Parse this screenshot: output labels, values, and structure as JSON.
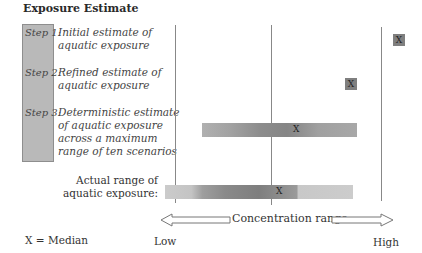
{
  "title": "Exposure Estimate",
  "steps": [
    {
      "label": "Step 1:",
      "description_lines": [
        "Initial estimate of",
        "aquatic exposure"
      ]
    },
    {
      "label": "Step 2:",
      "description_lines": [
        "Refined estimate of",
        "aquatic exposure"
      ]
    },
    {
      "label": "Step 3:",
      "description_lines": [
        "Deterministic estimate",
        "of aquatic exposure",
        "across a maximum",
        "range of ten scenarios"
      ]
    }
  ],
  "actual_range_label_lines": [
    "Actual range of",
    "aquatic exposure:"
  ],
  "median_marker": "X",
  "legend": "X = Median",
  "axis": {
    "label": "Concentration range",
    "low": "Low",
    "high": "High"
  },
  "colors": {
    "step_box": "#b9b9b9",
    "marker": "#7f7f7f",
    "bar_light": "#c8c8c8",
    "bar_mid": "#a8a8a8",
    "bar_dark": "#8a8a8a",
    "line": "#888888"
  }
}
